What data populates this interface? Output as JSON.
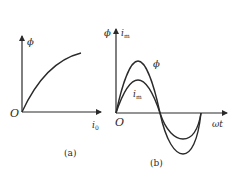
{
  "panel_a": {
    "caption": "(a)",
    "y_axis_label": "ϕ",
    "x_axis_label_main": "i",
    "x_axis_label_sub": "0",
    "origin_label": "O",
    "curve": "magnetization (saturation) curve ϕ vs i0"
  },
  "panel_b": {
    "caption": "(b)",
    "y_axis_label_phi": "ϕ",
    "y_axis_label_i_main": "i",
    "y_axis_label_i_sub": "m",
    "x_axis_label": "ωt",
    "origin_label": "O",
    "curve_phi_label": "ϕ",
    "curve_im_label_main": "i",
    "curve_im_label_sub": "m",
    "curves": [
      {
        "name": "ϕ",
        "type": "sinusoid",
        "amplitude": "larger"
      },
      {
        "name": "i_m",
        "type": "sinusoid",
        "amplitude": "smaller"
      }
    ]
  },
  "colors": {
    "stroke": "#2a2a2a",
    "background": "#ffffff"
  }
}
